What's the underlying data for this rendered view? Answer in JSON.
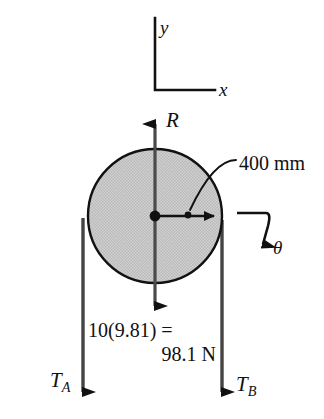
{
  "figure": {
    "colors": {
      "background": "#ffffff",
      "stroke": "#111111",
      "disk_fill": "#c9c9c9",
      "disk_edge": "#111111"
    },
    "axes": {
      "y_label": "y",
      "x_label": "x",
      "corner": {
        "x": 155,
        "y": 90
      },
      "y_top": 18,
      "x_right": 215
    },
    "disk": {
      "center": {
        "x": 155,
        "y": 216
      },
      "radius_px": 67,
      "radius_label": "400 mm",
      "fill": "#c9c9c9"
    },
    "forces": [
      {
        "name": "reaction",
        "label": "R",
        "direction": "up",
        "from": {
          "x": 155,
          "y": 216
        },
        "to": {
          "x": 155,
          "y": 112
        }
      },
      {
        "name": "weight",
        "label_line1": "10(9.81) =",
        "label_line2": "98.1 N",
        "value": 98.1,
        "unit": "N",
        "mass_kg": 10,
        "gravity": 9.81,
        "direction": "down",
        "from": {
          "x": 155,
          "y": 216
        },
        "to": {
          "x": 155,
          "y": 318
        }
      },
      {
        "name": "tension-a",
        "label": "T",
        "subscript": "A",
        "direction": "down",
        "from": {
          "x": 83,
          "y": 218
        },
        "to": {
          "x": 83,
          "y": 400
        }
      },
      {
        "name": "tension-b",
        "label": "T",
        "subscript": "B",
        "direction": "down",
        "from": {
          "x": 222,
          "y": 220
        },
        "to": {
          "x": 222,
          "y": 400
        }
      }
    ],
    "angular": {
      "label": "θ",
      "description": "angular acceleration / rotation sense arrow, clockwise",
      "start": {
        "x": 237,
        "y": 213
      },
      "corner": {
        "x": 268,
        "y": 213
      },
      "end": {
        "x": 262,
        "y": 258
      }
    },
    "radius_arrow": {
      "from": {
        "x": 155,
        "y": 216
      },
      "to": {
        "x": 222,
        "y": 216
      },
      "leader_dot": {
        "x": 188,
        "y": 215
      },
      "leader_text_anchor": {
        "x": 236,
        "y": 163
      }
    }
  }
}
